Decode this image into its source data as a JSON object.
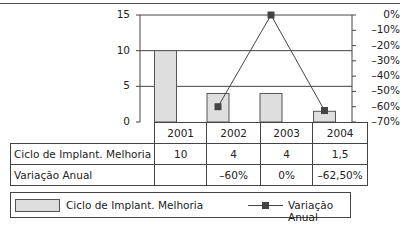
{
  "chart_data": {
    "type": "bar+line",
    "title": "",
    "categories": [
      "2001",
      "2002",
      "2003",
      "2004"
    ],
    "series": [
      {
        "name": "Ciclo de Implant. Melhoria",
        "type": "bar",
        "axis": "left",
        "values": [
          10,
          4,
          4,
          1.5
        ],
        "color": "#dedede"
      },
      {
        "name": "Variação Anual",
        "type": "line",
        "axis": "right",
        "values": [
          null,
          -60,
          0,
          -62.5
        ],
        "color": "#444444",
        "marker": "square"
      }
    ],
    "y_left": {
      "ylim": [
        0,
        15
      ],
      "ticks": [
        "15",
        "10",
        "5",
        "0"
      ],
      "gridlines": [
        15,
        10,
        5
      ]
    },
    "y_right": {
      "ylim": [
        -70,
        0
      ],
      "ticks": [
        "0%",
        "–10%",
        "–20%",
        "–30%",
        "–40%",
        "–50%",
        "–60%",
        "–70%"
      ]
    },
    "legend": {
      "position": "bottom"
    }
  },
  "axis_left": {
    "ticks": [
      "15",
      "10",
      "5",
      "0"
    ]
  },
  "axis_right": {
    "ticks": [
      "0%",
      "–10%",
      "–20%",
      "–30%",
      "–40%",
      "–50%",
      "–60%",
      "–70%"
    ]
  },
  "table": {
    "headers": [
      "2001",
      "2002",
      "2003",
      "2004"
    ],
    "rows": [
      {
        "label": "Ciclo de Implant. Melhoria",
        "cells": [
          "10",
          "4",
          "4",
          "1,5"
        ]
      },
      {
        "label": "Variação Anual",
        "cells": [
          "",
          "–60%",
          "0%",
          "–62,50%"
        ]
      }
    ]
  },
  "legend": {
    "bar_label": "Ciclo de Implant. Melhoria",
    "line_label": "Variação Anual"
  }
}
